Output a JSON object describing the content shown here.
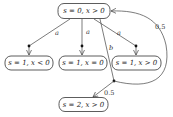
{
  "nodes": {
    "top": {
      "label": "s = 0, x > 0"
    },
    "left": {
      "label": "s = 1, x < 0"
    },
    "middle": {
      "label": "s = 1, x = 0"
    },
    "right": {
      "label": "s = 1, x > 0"
    },
    "bottom": {
      "label": "s = 2, x > 0"
    }
  },
  "edges": {
    "to_left": {
      "action": "a"
    },
    "to_middle": {
      "action": "a"
    },
    "to_right": {
      "action": "a"
    },
    "to_branch": {
      "action": "b"
    },
    "branch_to_bottom": {
      "prob": "0.5"
    },
    "branch_to_top": {
      "prob": "0.5"
    }
  },
  "colors": {
    "stroke": "#444444",
    "dot": "#111111",
    "background": "#ffffff"
  }
}
